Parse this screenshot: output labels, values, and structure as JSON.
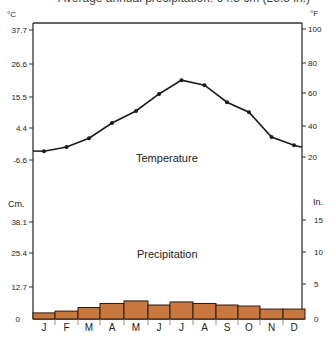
{
  "title": "Average annual precipitation: 64.8 cm (25.5 in.)",
  "labels": {
    "temperature": "Temperature",
    "precipitation": "Precipitation",
    "celsius_unit": "°C",
    "fahrenheit_unit": "°F",
    "cm_unit": "Cm.",
    "in_unit": "In."
  },
  "colors": {
    "bar_fill": "#c8773e",
    "bar_stroke": "#2a1a10",
    "line": "#1a1a1a",
    "axis": "#333333"
  },
  "chart_data": [
    {
      "type": "line",
      "title": "Temperature",
      "categories": [
        "J",
        "F",
        "M",
        "A",
        "M",
        "J",
        "J",
        "A",
        "S",
        "O",
        "N",
        "D"
      ],
      "values": [
        -3.6,
        -2.2,
        0.8,
        6.0,
        10.1,
        15.9,
        20.6,
        18.9,
        13.1,
        9.7,
        1.2,
        -1.6
      ],
      "ylabel": "°C",
      "ylabel_right": "°F",
      "y_ticks_left": [
        37.7,
        26.6,
        15.5,
        4.4,
        -6.6
      ],
      "y_ticks_right": [
        100,
        80,
        60,
        40,
        20
      ],
      "ylim": [
        -9.4,
        40.3
      ],
      "grid": false
    },
    {
      "type": "bar",
      "title": "Precipitation",
      "categories": [
        "J",
        "F",
        "M",
        "A",
        "M",
        "J",
        "J",
        "A",
        "S",
        "O",
        "N",
        "D"
      ],
      "values": [
        2.4,
        3.1,
        4.5,
        6.1,
        7.1,
        5.5,
        6.7,
        6.1,
        5.5,
        5.1,
        3.9,
        3.9
      ],
      "ylabel": "Cm.",
      "ylabel_right": "In.",
      "y_ticks_left": [
        "0",
        "12.7",
        "25.4",
        "38.1"
      ],
      "y_ticks_right": [
        "0",
        "5",
        "10",
        "15"
      ],
      "ylim": [
        0,
        38.1
      ],
      "grid": false
    }
  ]
}
